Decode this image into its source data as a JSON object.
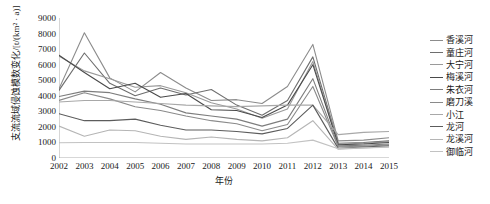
{
  "chart_data": {
    "type": "line",
    "title": "",
    "xlabel": "年份",
    "ylabel": "支流流域侵蚀模数变化/[t/(km² · a)]",
    "x": [
      2002,
      2003,
      2004,
      2005,
      2006,
      2007,
      2008,
      2009,
      2010,
      2011,
      2012,
      2013,
      2014,
      2015
    ],
    "xtick_labels": [
      "2002",
      "2003",
      "2004",
      "2005",
      "2006",
      "2007",
      "2008",
      "2009",
      "2010",
      "2011",
      "2012",
      "2013",
      "2014",
      "2015"
    ],
    "ytick_labels": [
      "0",
      "1000",
      "2000",
      "3000",
      "4000",
      "5000",
      "6000",
      "7000",
      "8000",
      "9000"
    ],
    "yticks": [
      0,
      1000,
      2000,
      3000,
      4000,
      5000,
      6000,
      7000,
      8000,
      9000
    ],
    "ylim": [
      0,
      9000
    ],
    "xlim": [
      2002,
      2015
    ],
    "grid": false,
    "legend_position": "right",
    "series": [
      {
        "name": "香溪河",
        "color": "#8c8c8c",
        "values": [
          4450,
          8050,
          5150,
          4250,
          5500,
          4500,
          3700,
          3750,
          3500,
          4600,
          7300,
          1100,
          1150,
          1300
        ]
      },
      {
        "name": "童庄河",
        "color": "#6e6e6e",
        "values": [
          4350,
          6750,
          4800,
          4000,
          4500,
          4050,
          4400,
          3400,
          2750,
          3700,
          6500,
          950,
          1000,
          1100
        ]
      },
      {
        "name": "大宁河",
        "color": "#9a9a9a",
        "values": [
          6550,
          5600,
          5100,
          4550,
          4650,
          4200,
          3550,
          3150,
          2550,
          3150,
          6200,
          900,
          950,
          1050
        ]
      },
      {
        "name": "梅溪河",
        "color": "#4a4a4a",
        "values": [
          6600,
          5500,
          4450,
          4800,
          3900,
          4150,
          3100,
          3050,
          2600,
          3400,
          6000,
          850,
          900,
          1000
        ]
      },
      {
        "name": "朱衣河",
        "color": "#7d7d7d",
        "values": [
          3950,
          4300,
          4200,
          3800,
          3450,
          2900,
          2700,
          2500,
          2050,
          2500,
          5100,
          780,
          820,
          900
        ]
      },
      {
        "name": "磨刀溪",
        "color": "#8a8a8a",
        "values": [
          3700,
          4200,
          3800,
          3300,
          3050,
          2700,
          2400,
          2200,
          1750,
          2150,
          4600,
          720,
          760,
          850
        ]
      },
      {
        "name": "小江",
        "color": "#a8a8a8",
        "values": [
          3600,
          3700,
          3700,
          3600,
          3500,
          3400,
          3350,
          3300,
          3350,
          3400,
          3400,
          1500,
          1650,
          1700
        ]
      },
      {
        "name": "龙河",
        "color": "#5c5c5c",
        "values": [
          2850,
          2400,
          2400,
          2500,
          2100,
          1800,
          1800,
          1700,
          1550,
          1900,
          3400,
          620,
          700,
          780
        ]
      },
      {
        "name": "龙溪河",
        "color": "#b5b5b5",
        "values": [
          2050,
          1400,
          1800,
          1750,
          1400,
          1200,
          1350,
          1200,
          1100,
          1300,
          2400,
          560,
          640,
          720
        ]
      },
      {
        "name": "御临河",
        "color": "#c2c2c2",
        "values": [
          980,
          1000,
          1000,
          1000,
          950,
          900,
          900,
          900,
          900,
          950,
          1150,
          600,
          650,
          700
        ]
      }
    ]
  }
}
